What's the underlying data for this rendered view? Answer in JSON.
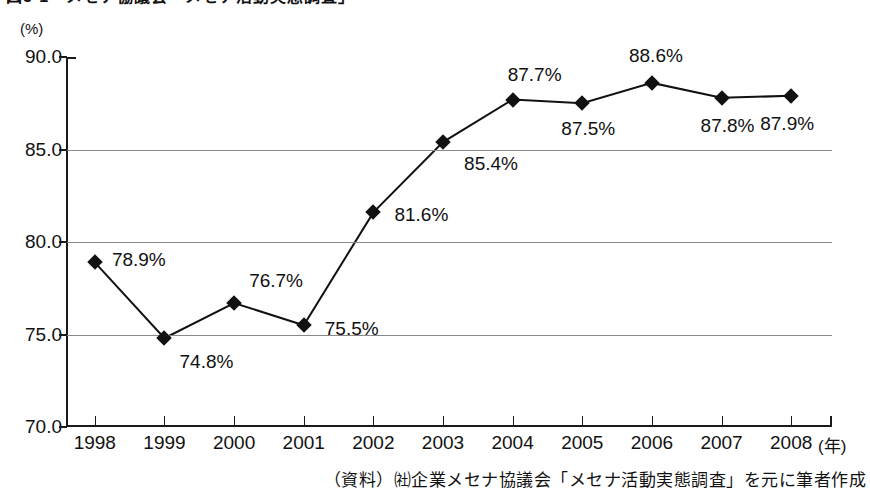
{
  "figure": {
    "title_partial": "図5-1　メセナ協議会「メセナ活動実態調査」",
    "unit_label": "(%)",
    "source_note": "（資料）㈳企業メセナ協議会「メセナ活動実態調査」を元に筆者作成",
    "x_axis_unit": "(年)"
  },
  "chart_data": {
    "type": "line",
    "title": "",
    "xlabel": "(年)",
    "ylabel": "(%)",
    "ylim": [
      70.0,
      90.0
    ],
    "ytick_labels": [
      "90.0",
      "85.0",
      "80.0",
      "75.0",
      "70.0"
    ],
    "ytick_values": [
      90.0,
      85.0,
      80.0,
      75.0,
      70.0
    ],
    "grid": "horizontal",
    "legend": "none",
    "categories": [
      "1998",
      "1999",
      "2000",
      "2001",
      "2002",
      "2003",
      "2004",
      "2005",
      "2006",
      "2007",
      "2008"
    ],
    "values": [
      78.9,
      74.8,
      76.7,
      75.5,
      81.6,
      85.4,
      87.7,
      87.5,
      88.6,
      87.8,
      87.9
    ],
    "point_labels": [
      "78.9%",
      "74.8%",
      "76.7%",
      "75.5%",
      "81.6%",
      "85.4%",
      "87.7%",
      "87.5%",
      "88.6%",
      "87.8%",
      "87.9%"
    ],
    "label_offsets": [
      {
        "dx": 44,
        "dy": -2
      },
      {
        "dx": 42,
        "dy": 24
      },
      {
        "dx": 42,
        "dy": -22
      },
      {
        "dx": 48,
        "dy": 4
      },
      {
        "dx": 48,
        "dy": 3
      },
      {
        "dx": 48,
        "dy": 22
      },
      {
        "dx": 22,
        "dy": -25
      },
      {
        "dx": 6,
        "dy": 26
      },
      {
        "dx": 4,
        "dy": -27
      },
      {
        "dx": 6,
        "dy": 28
      },
      {
        "dx": -4,
        "dy": 28
      }
    ],
    "marker": "diamond",
    "line_color": "#111111",
    "marker_color": "#111111",
    "grid_color": "#8a8a8a"
  }
}
